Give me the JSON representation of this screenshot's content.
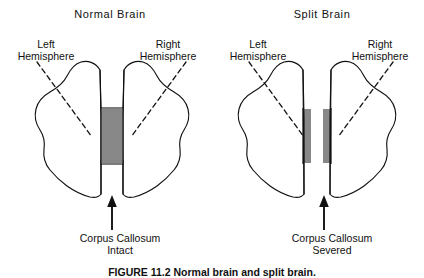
{
  "figure": {
    "caption": "FIGURE 11.2  Normal brain and split brain.",
    "background_color": "#ffffff",
    "ink_color": "#111111"
  },
  "panels": [
    {
      "id": "normal-brain",
      "title": "Normal Brain",
      "left_label_line1": "Left",
      "left_label_line2": "Hemisphere",
      "right_label_line1": "Right",
      "right_label_line2": "Hemisphere",
      "callout_line1": "Corpus Callosum",
      "callout_line2": "Intact",
      "corpus_callosum_state": "intact",
      "hatch_count": 26
    },
    {
      "id": "split-brain",
      "title": "Split Brain",
      "left_label_line1": "Left",
      "left_label_line2": "Hemisphere",
      "right_label_line1": "Right",
      "right_label_line2": "Hemisphere",
      "callout_line1": "Corpus Callosum",
      "callout_line2": "Severed",
      "corpus_callosum_state": "severed",
      "hatch_count": 26
    }
  ]
}
